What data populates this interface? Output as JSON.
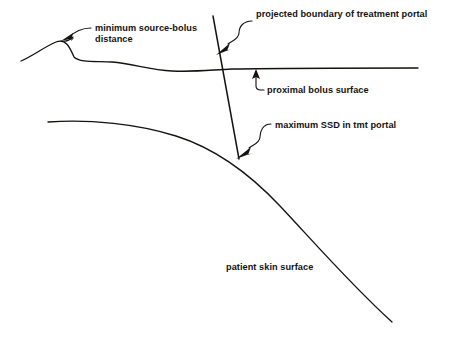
{
  "figure": {
    "kind": "medical-physics-schematic",
    "background_color": "#ffffff",
    "ink_color": "#15120f"
  },
  "labels": {
    "minimum_source_bolus": {
      "line1": "minimum source-bolus",
      "line2": "distance"
    },
    "projected_boundary": "projected boundary of treatment portal",
    "proximal_bolus": "proximal bolus surface",
    "maximum_ssd": "maximum SSD in tmt portal",
    "patient_skin": "patient skin surface"
  },
  "annotations": [
    {
      "name": "minimum-source-bolus-distance",
      "leader_style": "curved-hook",
      "arrow_target": "bolus surface crest",
      "arrow_direction": "down-left"
    },
    {
      "name": "projected-boundary-of-treatment-portal",
      "leader_style": "s-curve",
      "arrow_target": "portal boundary line",
      "arrow_direction": "down-left"
    },
    {
      "name": "proximal-bolus-surface",
      "leader_style": "elbow",
      "arrow_target": "bolus surface underside",
      "arrow_direction": "up"
    },
    {
      "name": "maximum-ssd-in-tmt-portal",
      "leader_style": "s-curve",
      "arrow_target": "intersection of portal line and skin surface",
      "arrow_direction": "down-left"
    },
    {
      "name": "patient-skin-surface",
      "leader_style": "none",
      "arrow_target": "none",
      "arrow_direction": "none"
    }
  ],
  "geometry": {
    "bolus_surface": {
      "description": "irregular near-horizontal contour with a raised crest at left",
      "path": "M 21 61 C 33 56 44 47 56 42 C 66 38 70 48 74 57 C 80 63 96 61 112 62 C 134 64 150 70 172 71 C 196 72 210 70 232 69 C 290 68 356 68 418 68"
    },
    "portal_boundary_line": {
      "description": "straight diagonal line, projected field edge",
      "x1": 213,
      "y1": 16,
      "x2": 239,
      "y2": 159
    },
    "patient_skin_surface": {
      "description": "broad convex contour falling away to lower right",
      "path": "M 48 122 C 90 119 138 124 176 136 C 214 148 248 172 280 206 C 312 240 352 286 392 322"
    }
  },
  "text_positions": {
    "minimum_source_bolus_x": 95,
    "minimum_source_bolus_y": 31,
    "projected_boundary_x": 256,
    "projected_boundary_y": 17,
    "proximal_bolus_x": 267,
    "proximal_bolus_y": 91,
    "maximum_ssd_x": 275,
    "maximum_ssd_y": 128,
    "patient_skin_x": 226,
    "patient_skin_y": 270
  }
}
